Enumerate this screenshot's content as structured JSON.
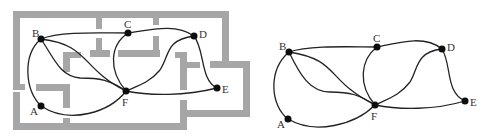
{
  "figure": {
    "left_panel": {
      "description": "floor plan with graph overlay",
      "nodes": [
        {
          "id": "A",
          "label": "A"
        },
        {
          "id": "B",
          "label": "B"
        },
        {
          "id": "C",
          "label": "C"
        },
        {
          "id": "D",
          "label": "D"
        },
        {
          "id": "E",
          "label": "E"
        },
        {
          "id": "F",
          "label": "F"
        }
      ]
    },
    "right_panel": {
      "description": "extracted graph",
      "nodes": [
        {
          "id": "A",
          "label": "A"
        },
        {
          "id": "B",
          "label": "B"
        },
        {
          "id": "C",
          "label": "C"
        },
        {
          "id": "D",
          "label": "D"
        },
        {
          "id": "E",
          "label": "E"
        },
        {
          "id": "F",
          "label": "F"
        }
      ]
    },
    "edges": [
      [
        "A",
        "B"
      ],
      [
        "A",
        "F"
      ],
      [
        "B",
        "C"
      ],
      [
        "B",
        "F"
      ],
      [
        "B",
        "F"
      ],
      [
        "B",
        "F"
      ],
      [
        "C",
        "D"
      ],
      [
        "C",
        "F"
      ],
      [
        "D",
        "F"
      ],
      [
        "D",
        "E"
      ],
      [
        "E",
        "F"
      ]
    ],
    "colors": {
      "wall": "#a6a6a6",
      "edge": "#222222",
      "node": "#0d0d0d",
      "label": "#333333"
    }
  }
}
